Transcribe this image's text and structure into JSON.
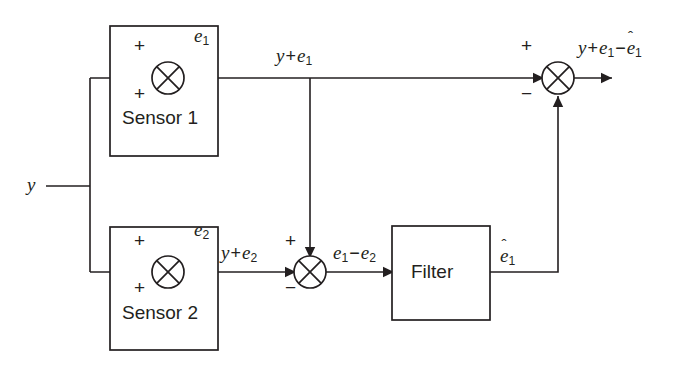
{
  "diagram": {
    "stroke_color": "#231f20",
    "background_color": "#ffffff",
    "width": 690,
    "height": 373,
    "blocks": [
      {
        "id": "sensor1",
        "label": "Sensor 1",
        "x": 110,
        "y": 26,
        "w": 108,
        "h": 130
      },
      {
        "id": "sensor2",
        "label": "Sensor 2",
        "x": 110,
        "y": 227,
        "w": 108,
        "h": 123
      },
      {
        "id": "filter",
        "label": "Filter",
        "x": 392,
        "y": 226,
        "w": 98,
        "h": 94
      }
    ],
    "summers": [
      {
        "id": "summer1",
        "cx": 168,
        "cy": 78,
        "r": 16,
        "signs": [
          {
            "text": "+",
            "x": 134,
            "y": 44
          },
          {
            "text": "+",
            "x": 134,
            "y": 86
          }
        ],
        "noise_label": "e1"
      },
      {
        "id": "summer2",
        "cx": 168,
        "cy": 272,
        "r": 16,
        "signs": [
          {
            "text": "+",
            "x": 134,
            "y": 238
          },
          {
            "text": "+",
            "x": 134,
            "y": 280
          }
        ],
        "noise_label": "e2"
      },
      {
        "id": "summer_diff",
        "cx": 310,
        "cy": 272,
        "r": 16,
        "signs": [
          {
            "text": "+",
            "x": 282,
            "y": 238
          },
          {
            "text": "−",
            "x": 282,
            "y": 280
          }
        ],
        "noise_label": ""
      },
      {
        "id": "summer_out",
        "cx": 558,
        "cy": 78,
        "r": 16,
        "signs": [
          {
            "text": "+",
            "x": 522,
            "y": 44
          },
          {
            "text": "−",
            "x": 522,
            "y": 86
          }
        ],
        "noise_label": ""
      }
    ],
    "labels": {
      "input_y": "y",
      "sensor1_noise": {
        "base": "e",
        "sub": "1"
      },
      "sensor2_noise": {
        "base": "e",
        "sub": "2"
      },
      "sensor1_output": {
        "parts": "y + e",
        "sub": "1"
      },
      "sensor2_output": {
        "parts": "y + e",
        "sub": "2"
      },
      "error_difference": {
        "first": "e",
        "first_sub": "1",
        "op": "−",
        "second": "e",
        "second_sub": "2"
      },
      "filter_output": {
        "base": "e",
        "sub": "1",
        "hat": "ˆ"
      },
      "final_output": {
        "y": "y",
        "op1": "+",
        "e1": "e",
        "e1_sub": "1",
        "op2": "−",
        "ehat": "e",
        "ehat_sub": "1",
        "hat": "ˆ"
      }
    },
    "label_positions": {
      "input_y": {
        "x": 27,
        "y": 175
      },
      "sensor1_noise": {
        "x": 194,
        "y": 30
      },
      "sensor2_noise": {
        "x": 194,
        "y": 224
      },
      "sensor1_output": {
        "x": 278,
        "y": 47
      },
      "sensor2_output": {
        "x": 222,
        "y": 244
      },
      "error_difference": {
        "x": 334,
        "y": 244
      },
      "filter_output": {
        "x": 500,
        "y": 248
      },
      "final_output": {
        "x": 578,
        "y": 39
      },
      "sensor1_block": {
        "x": 122,
        "y": 118
      },
      "sensor2_block": {
        "x": 122,
        "y": 313
      },
      "filter_block": {
        "x": 411,
        "y": 262
      }
    },
    "wires": [
      {
        "id": "input-y-wire",
        "d": "M 46 186 L 90 186"
      },
      {
        "id": "input-branch-vertical",
        "d": "M 90 186 L 90 78 M 90 186 L 90 272"
      },
      {
        "id": "sensor1-input-wire",
        "d": "M 90 78 L 152 78"
      },
      {
        "id": "sensor2-input-wire",
        "d": "M 90 272 L 152 272"
      },
      {
        "id": "sensor1-noise-input",
        "d": "M 185 36 L 185 62"
      },
      {
        "id": "sensor2-noise-input",
        "d": "M 185 230 L 185 256"
      },
      {
        "id": "sensor1-output-wire",
        "d": "M 184 78 L 542 78"
      },
      {
        "id": "branch-to-diff-summer",
        "d": "M 310 78 L 310 256"
      },
      {
        "id": "sensor2-output-wire",
        "d": "M 184 272 L 294 272"
      },
      {
        "id": "diff-summer-to-filter",
        "d": "M 326 272 L 392 272"
      },
      {
        "id": "filter-to-feedback",
        "d": "M 490 272 L 558 272 L 558 94"
      }
    ],
    "arrows": [
      {
        "id": "arrow-sensor1-input",
        "x": 152,
        "y": 78,
        "dir": "right"
      },
      {
        "id": "arrow-sensor2-input",
        "x": 152,
        "y": 272,
        "dir": "right"
      },
      {
        "id": "arrow-sensor1-noise",
        "x": 185,
        "y": 62,
        "dir": "down"
      },
      {
        "id": "arrow-sensor2-noise",
        "x": 185,
        "y": 256,
        "dir": "down"
      },
      {
        "id": "arrow-branch-down",
        "x": 310,
        "y": 256,
        "dir": "down"
      },
      {
        "id": "arrow-sensor2-to-diff",
        "x": 294,
        "y": 272,
        "dir": "right"
      },
      {
        "id": "arrow-diff-to-filter",
        "x": 392,
        "y": 272,
        "dir": "right"
      },
      {
        "id": "arrow-feedback-up",
        "x": 558,
        "y": 94,
        "dir": "up"
      },
      {
        "id": "arrow-summer-out-input",
        "x": 542,
        "y": 78,
        "dir": "right"
      },
      {
        "id": "arrow-final-output",
        "x": 610,
        "y": 78,
        "dir": "right"
      }
    ],
    "final_output_wire": {
      "id": "summer-out-to-output",
      "d": "M 574 78 L 610 78"
    }
  }
}
